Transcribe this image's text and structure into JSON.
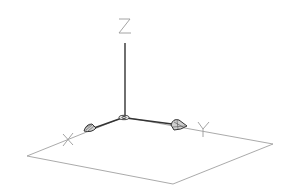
{
  "diagram": {
    "type": "ucs-icon-3d",
    "axes": [
      {
        "name": "x",
        "label": "X"
      },
      {
        "name": "y",
        "label": "Y"
      },
      {
        "name": "z",
        "label": "Z"
      }
    ]
  },
  "colors": {
    "background": "#ffffff",
    "axis_line": "#222222",
    "plane_line": "#9a9a9a",
    "label": "#8c8c8c"
  }
}
